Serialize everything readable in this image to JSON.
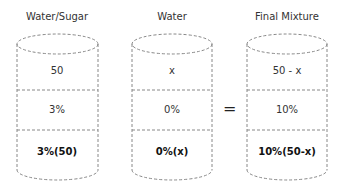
{
  "columns": [
    {
      "title": "Water/Sugar",
      "amount": "50",
      "concentration": "3%",
      "product": "3%(50)"
    },
    {
      "title": "Water",
      "amount": "x",
      "concentration": "0%",
      "product": "0%(x)"
    },
    {
      "title": "Final Mixture",
      "amount": "50 - x",
      "concentration": "10%",
      "product": "10%(50-x)"
    }
  ],
  "operator": "="
}
